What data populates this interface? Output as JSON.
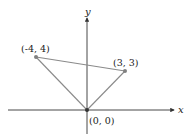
{
  "diagram": {
    "type": "coordinate-plane-triangle",
    "axes": {
      "x_label": "x",
      "y_label": "y"
    },
    "points": [
      {
        "label": "(-4, 4)",
        "x": -4,
        "y": 4
      },
      {
        "label": "(3, 3)",
        "x": 3,
        "y": 3
      },
      {
        "label": "(0, 0)",
        "x": 0,
        "y": 0
      }
    ],
    "segments": [
      [
        "(-4, 4)",
        "(3, 3)"
      ],
      [
        "(-4, 4)",
        "(0, 0)"
      ],
      [
        "(3, 3)",
        "(0, 0)"
      ]
    ],
    "colors": {
      "axis": "#333333",
      "triangle": "#8a8a8a",
      "point": "#808080"
    }
  }
}
